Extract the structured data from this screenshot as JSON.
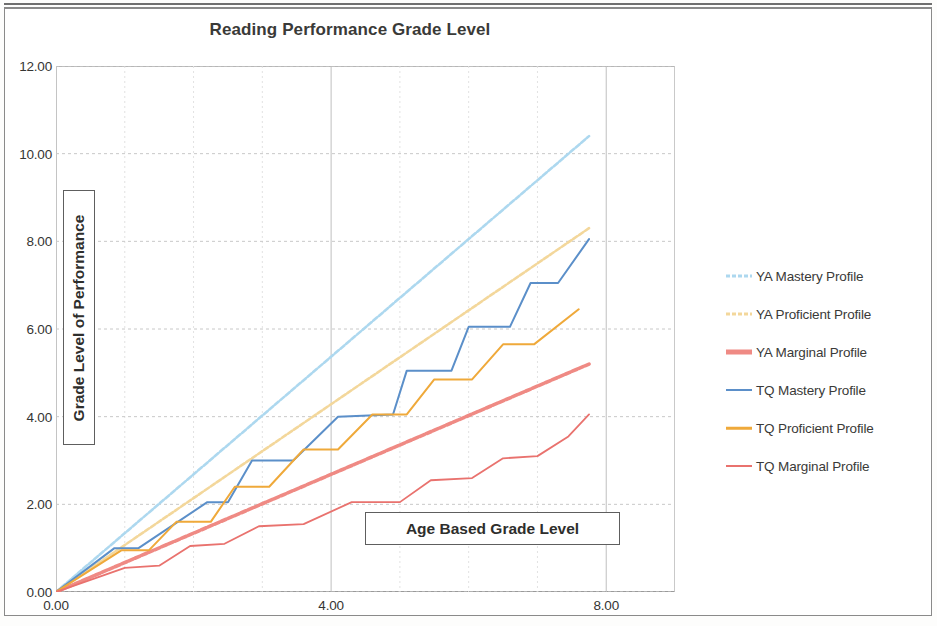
{
  "document": {
    "frame_visible": true,
    "background": "#ffffff"
  },
  "chart_data": {
    "type": "line",
    "title": "Reading Performance Grade Level",
    "xlabel": "Age Based Grade Level",
    "ylabel": "Grade Level of Performance",
    "xlim": [
      0,
      9
    ],
    "ylim": [
      0,
      12
    ],
    "xticks": [
      "0.00",
      "4.00",
      "8.00"
    ],
    "xtick_values": [
      0,
      4,
      8
    ],
    "yticks": [
      "0.00",
      "2.00",
      "4.00",
      "6.00",
      "8.00",
      "10.00",
      "12.00"
    ],
    "ytick_values": [
      0,
      2,
      4,
      6,
      8,
      10,
      12
    ],
    "grid": true,
    "grid_major_x": [
      0,
      4,
      8
    ],
    "grid_minor_x": [
      1,
      2,
      3,
      5,
      6,
      7
    ],
    "grid_major_y": [
      0,
      2,
      4,
      6,
      8,
      10,
      12
    ],
    "legend_position": "right",
    "series": [
      {
        "name": "YA Mastery Profile",
        "color": "#add8ef",
        "style": "dashed",
        "width": 2.6,
        "points": [
          [
            0,
            0
          ],
          [
            7.75,
            10.4
          ]
        ]
      },
      {
        "name": "YA Proficient Profile",
        "color": "#f3d79b",
        "style": "dashed",
        "width": 2.6,
        "points": [
          [
            0,
            0
          ],
          [
            7.75,
            8.3
          ]
        ]
      },
      {
        "name": "YA Marginal Profile",
        "color": "#ef8a84",
        "style": "dashed",
        "width": 3.6,
        "points": [
          [
            0,
            0
          ],
          [
            7.75,
            5.2
          ]
        ]
      },
      {
        "name": "TQ Mastery Profile",
        "color": "#5b8fc9",
        "style": "solid",
        "width": 2.0,
        "points": [
          [
            0,
            0
          ],
          [
            0.85,
            1.0
          ],
          [
            1.2,
            1.0
          ],
          [
            2.2,
            2.05
          ],
          [
            2.5,
            2.05
          ],
          [
            2.85,
            3.0
          ],
          [
            3.45,
            3.0
          ],
          [
            4.1,
            4.0
          ],
          [
            4.9,
            4.05
          ],
          [
            5.1,
            5.05
          ],
          [
            5.75,
            5.05
          ],
          [
            6.0,
            6.05
          ],
          [
            6.6,
            6.05
          ],
          [
            6.9,
            7.05
          ],
          [
            7.3,
            7.05
          ],
          [
            7.75,
            8.05
          ]
        ]
      },
      {
        "name": "TQ Proficient Profile",
        "color": "#efa93a",
        "style": "solid",
        "width": 2.0,
        "points": [
          [
            0,
            0
          ],
          [
            0.95,
            0.95
          ],
          [
            1.35,
            0.95
          ],
          [
            1.75,
            1.6
          ],
          [
            2.25,
            1.6
          ],
          [
            2.6,
            2.4
          ],
          [
            3.1,
            2.4
          ],
          [
            3.6,
            3.25
          ],
          [
            4.1,
            3.25
          ],
          [
            4.6,
            4.05
          ],
          [
            5.1,
            4.05
          ],
          [
            5.5,
            4.85
          ],
          [
            6.05,
            4.85
          ],
          [
            6.5,
            5.65
          ],
          [
            6.95,
            5.65
          ],
          [
            7.6,
            6.45
          ]
        ]
      },
      {
        "name": "TQ Marginal Profile",
        "color": "#e9726e",
        "style": "solid",
        "width": 1.8,
        "points": [
          [
            0,
            0
          ],
          [
            1.0,
            0.55
          ],
          [
            1.5,
            0.6
          ],
          [
            1.95,
            1.05
          ],
          [
            2.45,
            1.1
          ],
          [
            2.95,
            1.5
          ],
          [
            3.6,
            1.55
          ],
          [
            4.3,
            2.05
          ],
          [
            5.0,
            2.05
          ],
          [
            5.45,
            2.55
          ],
          [
            6.05,
            2.6
          ],
          [
            6.5,
            3.05
          ],
          [
            7.0,
            3.1
          ],
          [
            7.45,
            3.55
          ],
          [
            7.75,
            4.05
          ]
        ]
      }
    ]
  },
  "legend": {
    "items": [
      {
        "label": "YA Mastery Profile",
        "color": "#add8ef",
        "style": "dashed",
        "thickness": 3
      },
      {
        "label": "YA Proficient Profile",
        "color": "#f3d79b",
        "style": "dashed",
        "thickness": 3
      },
      {
        "label": "YA Marginal Profile",
        "color": "#ef8a84",
        "style": "solid",
        "thickness": 5
      },
      {
        "label": "TQ Mastery Profile",
        "color": "#5b8fc9",
        "style": "solid",
        "thickness": 2
      },
      {
        "label": "TQ Proficient Profile",
        "color": "#efa93a",
        "style": "solid",
        "thickness": 2.5
      },
      {
        "label": "TQ Marginal Profile",
        "color": "#e9726e",
        "style": "solid",
        "thickness": 2
      }
    ]
  }
}
